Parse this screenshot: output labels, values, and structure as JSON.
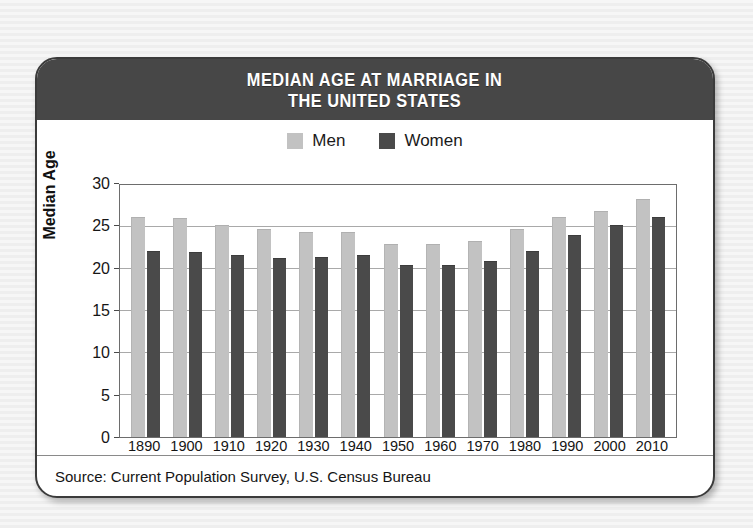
{
  "card": {
    "header_title_line1": "MEDIAN AGE AT MARRIAGE IN",
    "header_title_line2": "THE UNITED STATES",
    "source": "Source: Current Population Survey, U.S. Census Bureau"
  },
  "legend": {
    "items": [
      {
        "label": "Men",
        "color": "#c2c2c2"
      },
      {
        "label": "Women",
        "color": "#4a4a4a"
      }
    ]
  },
  "axis": {
    "ylabel": "Median Age",
    "yticks": [
      "0",
      "5",
      "10",
      "15",
      "20",
      "25",
      "30"
    ]
  },
  "colors": {
    "header_band": "#474747",
    "men_bar": "#c2c2c2",
    "women_bar": "#4a4a4a",
    "card_border": "#3b3b3b",
    "page_background": "#f2f2f2",
    "gridline": "#a9a9a9"
  },
  "chart_data": {
    "type": "bar",
    "title": "MEDIAN AGE AT MARRIAGE IN THE UNITED STATES",
    "subtitle": "",
    "xlabel": "",
    "ylabel": "Median Age",
    "ylim": [
      0,
      30
    ],
    "ytick_step": 5,
    "grid": true,
    "legend_position": "top-center",
    "source": "Source: Current Population Survey, U.S. Census Bureau",
    "categories": [
      "1890",
      "1900",
      "1910",
      "1920",
      "1930",
      "1940",
      "1950",
      "1960",
      "1970",
      "1980",
      "1990",
      "2000",
      "2010"
    ],
    "series": [
      {
        "name": "Men",
        "color": "#c2c2c2",
        "values": [
          26.1,
          25.9,
          25.1,
          24.6,
          24.3,
          24.3,
          22.8,
          22.8,
          23.2,
          24.7,
          26.1,
          26.8,
          28.2
        ]
      },
      {
        "name": "Women",
        "color": "#4a4a4a",
        "values": [
          22.0,
          21.9,
          21.6,
          21.2,
          21.3,
          21.5,
          20.3,
          20.3,
          20.8,
          22.0,
          23.9,
          25.1,
          26.1
        ]
      }
    ]
  }
}
